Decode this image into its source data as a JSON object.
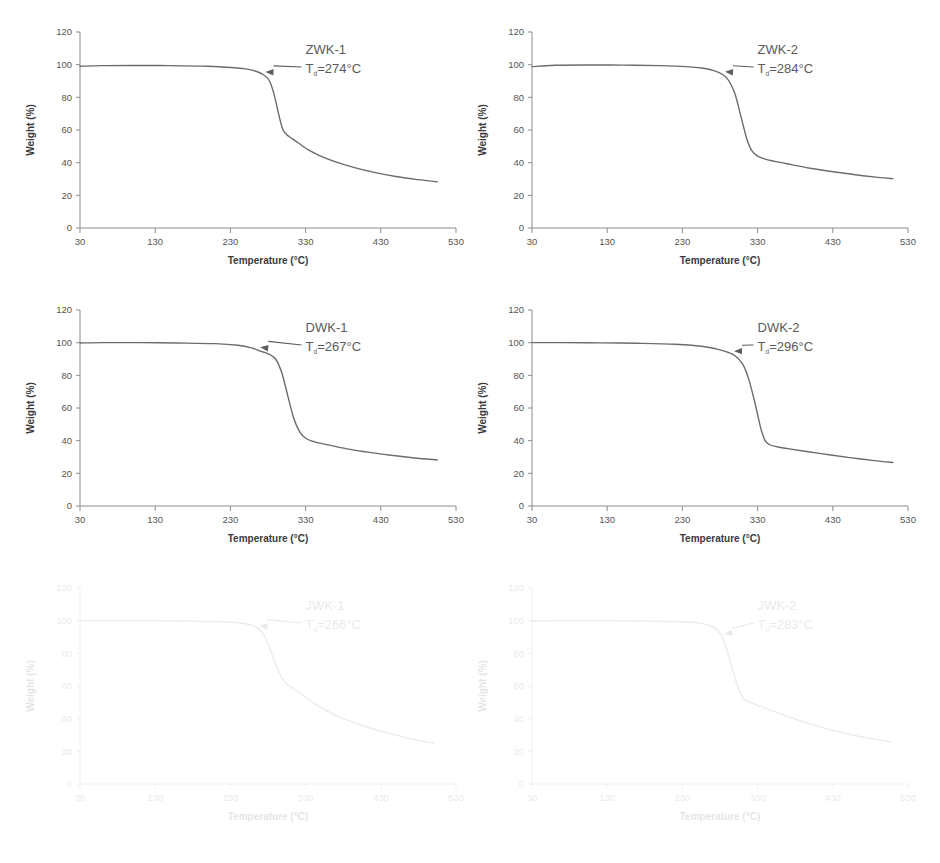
{
  "figure": {
    "panel_count": 6,
    "background_color": "#ffffff",
    "curve_color": "#6b6b6b",
    "axis_color": "#8c8c8c"
  },
  "axes": {
    "x_label": "Temperature (°C)",
    "y_label": "Weight (%)",
    "x_ticks": [
      "30",
      "130",
      "230",
      "330",
      "430",
      "530"
    ],
    "y_ticks": [
      "0",
      "20",
      "40",
      "60",
      "80",
      "100",
      "120"
    ],
    "x_min": 30,
    "x_max": 530,
    "y_min": 0,
    "y_max": 120
  },
  "annotation": {
    "td_prefix": "T",
    "td_subscript": "d",
    "td_equals": "=",
    "degree_unit": "°C"
  },
  "chart_data": [
    {
      "type": "line",
      "id": "zwk-1",
      "title": "ZWK-1",
      "td_label": "T_d=274°C",
      "td_value": 274,
      "xlabel": "Temperature (°C)",
      "ylabel": "Weight (%)",
      "xlim": [
        30,
        530
      ],
      "ylim": [
        0,
        120
      ],
      "grid": false,
      "faded": false,
      "x": [
        30,
        60,
        100,
        150,
        200,
        230,
        250,
        265,
        275,
        282,
        288,
        294,
        300,
        308,
        316,
        325,
        335,
        350,
        370,
        395,
        420,
        450,
        480,
        505
      ],
      "y": [
        99.0,
        99.4,
        99.5,
        99.4,
        99.0,
        98.3,
        97.4,
        95.8,
        93.5,
        90.0,
        82.0,
        70.0,
        60.0,
        56.0,
        53.5,
        50.5,
        47.5,
        44.0,
        40.5,
        37.0,
        34.2,
        31.5,
        29.6,
        28.3
      ]
    },
    {
      "type": "line",
      "id": "zwk-2",
      "title": "ZWK-2",
      "td_label": "T_d=284°C",
      "td_value": 284,
      "xlabel": "Temperature (°C)",
      "ylabel": "Weight (%)",
      "xlim": [
        30,
        530
      ],
      "ylim": [
        0,
        120
      ],
      "grid": false,
      "faded": false,
      "x": [
        30,
        60,
        100,
        150,
        200,
        235,
        258,
        272,
        284,
        292,
        300,
        308,
        316,
        322,
        330,
        340,
        355,
        375,
        400,
        430,
        460,
        490,
        510
      ],
      "y": [
        98.8,
        99.6,
        99.8,
        99.7,
        99.4,
        98.8,
        97.8,
        96.3,
        93.8,
        90.0,
        82.0,
        68.0,
        54.0,
        47.5,
        44.0,
        42.2,
        40.6,
        38.8,
        36.6,
        34.4,
        32.6,
        31.0,
        30.2
      ]
    },
    {
      "type": "line",
      "id": "dwk-1",
      "title": "DWK-1",
      "td_label": "T_d=267°C",
      "td_value": 267,
      "xlabel": "Temperature (°C)",
      "ylabel": "Weight (%)",
      "xlim": [
        30,
        530
      ],
      "ylim": [
        0,
        120
      ],
      "grid": false,
      "faded": false,
      "x": [
        30,
        60,
        110,
        160,
        210,
        240,
        258,
        270,
        280,
        290,
        298,
        306,
        314,
        322,
        330,
        342,
        360,
        385,
        415,
        445,
        475,
        505
      ],
      "y": [
        99.8,
        100.0,
        100.0,
        99.8,
        99.4,
        98.4,
        96.8,
        94.8,
        93.2,
        90.0,
        82.0,
        68.0,
        54.0,
        45.5,
        41.5,
        39.3,
        37.4,
        35.0,
        32.8,
        31.0,
        29.4,
        28.2
      ]
    },
    {
      "type": "line",
      "id": "dwk-2",
      "title": "DWK-2",
      "td_label": "T_d=296°C",
      "td_value": 296,
      "xlabel": "Temperature (°C)",
      "ylabel": "Weight (%)",
      "xlim": [
        30,
        530
      ],
      "ylim": [
        0,
        120
      ],
      "grid": false,
      "faded": false,
      "x": [
        30,
        70,
        120,
        170,
        220,
        255,
        275,
        290,
        300,
        310,
        318,
        326,
        334,
        340,
        346,
        356,
        372,
        395,
        425,
        455,
        485,
        510
      ],
      "y": [
        100.0,
        100.0,
        99.9,
        99.6,
        99.0,
        97.8,
        96.2,
        94.2,
        92.0,
        87.0,
        78.0,
        64.0,
        48.0,
        40.0,
        37.5,
        36.3,
        35.0,
        33.4,
        31.4,
        29.5,
        27.8,
        26.6
      ]
    },
    {
      "type": "line",
      "id": "jwk-1",
      "title": "JWK-1",
      "td_label": "T_d=266°C",
      "td_value": 266,
      "xlabel": "Temperature (°C)",
      "ylabel": "Weight (%)",
      "xlim": [
        30,
        530
      ],
      "ylim": [
        0,
        120
      ],
      "grid": false,
      "faded": true,
      "x": [
        30,
        70,
        120,
        170,
        215,
        245,
        262,
        272,
        280,
        288,
        295,
        302,
        310,
        320,
        332,
        348,
        368,
        392,
        418,
        445,
        472,
        500
      ],
      "y": [
        100.0,
        100.0,
        100.0,
        99.8,
        99.4,
        98.4,
        96.5,
        93.0,
        86.0,
        76.0,
        68.0,
        62.5,
        59.5,
        56.5,
        52.5,
        47.5,
        42.5,
        38.0,
        34.0,
        30.5,
        27.5,
        25.0
      ]
    },
    {
      "type": "line",
      "id": "jwk-2",
      "title": "JWK-2",
      "td_label": "T_d=283°C",
      "td_value": 283,
      "xlabel": "Temperature (°C)",
      "ylabel": "Weight (%)",
      "xlim": [
        30,
        530
      ],
      "ylim": [
        0,
        120
      ],
      "grid": false,
      "faded": true,
      "x": [
        30,
        70,
        120,
        170,
        215,
        248,
        265,
        276,
        284,
        292,
        298,
        305,
        312,
        320,
        334,
        352,
        375,
        400,
        430,
        460,
        490,
        508
      ],
      "y": [
        99.8,
        100.0,
        100.0,
        99.8,
        99.5,
        98.8,
        97.2,
        94.5,
        89.0,
        78.0,
        68.0,
        58.0,
        52.0,
        50.0,
        47.5,
        44.5,
        40.5,
        36.8,
        32.8,
        29.6,
        27.0,
        25.8
      ]
    }
  ]
}
